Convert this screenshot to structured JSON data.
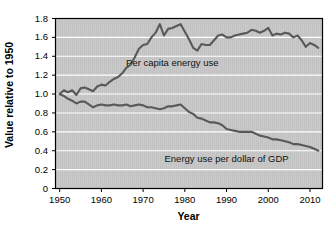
{
  "chart_data": {
    "type": "line",
    "title": "",
    "xlabel": "Year",
    "ylabel": "Value relative to 1950",
    "xlim": [
      1949,
      2013
    ],
    "ylim": [
      0,
      1.8
    ],
    "xticks": [
      1950,
      1960,
      1970,
      1980,
      1990,
      2000,
      2010
    ],
    "xtick_labels": [
      "1950",
      "1960",
      "1970",
      "1980",
      "1990",
      "2000",
      "2010"
    ],
    "yticks": [
      0,
      0.2,
      0.4,
      0.6,
      0.8,
      1.0,
      1.2,
      1.4,
      1.6,
      1.8
    ],
    "ytick_labels": [
      "0",
      "0.2",
      "0.4",
      "0.6",
      "0.8",
      "1.0",
      "1.2",
      "1.4",
      "1.6",
      "1.8"
    ],
    "grid": "horizontal-white",
    "legend": "inline-annotations",
    "plot_bgcolor": "#c9c9c9",
    "line_color": "#595959",
    "gridline_color": "#ffffff",
    "border_color": "#000000",
    "annotations": [
      {
        "text": "Per capita energy use",
        "x": 1977,
        "y": 1.3
      },
      {
        "text": "Energy use per dollar of GDP",
        "x": 1990,
        "y": 0.28
      }
    ],
    "series": [
      {
        "name": "Per capita energy use",
        "x": [
          1950,
          1951,
          1952,
          1953,
          1954,
          1955,
          1956,
          1957,
          1958,
          1959,
          1960,
          1961,
          1962,
          1963,
          1964,
          1965,
          1966,
          1967,
          1968,
          1969,
          1970,
          1971,
          1972,
          1973,
          1974,
          1975,
          1976,
          1977,
          1978,
          1979,
          1980,
          1981,
          1982,
          1983,
          1984,
          1985,
          1986,
          1987,
          1988,
          1989,
          1990,
          1991,
          1992,
          1993,
          1994,
          1995,
          1996,
          1997,
          1998,
          1999,
          2000,
          2001,
          2002,
          2003,
          2004,
          2005,
          2006,
          2007,
          2008,
          2009,
          2010,
          2011,
          2012
        ],
        "values": [
          1.0,
          1.04,
          1.02,
          1.04,
          0.99,
          1.06,
          1.07,
          1.05,
          1.03,
          1.08,
          1.1,
          1.09,
          1.13,
          1.16,
          1.18,
          1.22,
          1.28,
          1.31,
          1.39,
          1.48,
          1.52,
          1.53,
          1.6,
          1.65,
          1.74,
          1.62,
          1.69,
          1.7,
          1.72,
          1.74,
          1.66,
          1.58,
          1.49,
          1.46,
          1.53,
          1.52,
          1.52,
          1.57,
          1.62,
          1.63,
          1.6,
          1.6,
          1.62,
          1.63,
          1.64,
          1.65,
          1.68,
          1.67,
          1.65,
          1.67,
          1.7,
          1.62,
          1.64,
          1.63,
          1.65,
          1.64,
          1.6,
          1.62,
          1.57,
          1.5,
          1.54,
          1.52,
          1.49
        ]
      },
      {
        "name": "Energy use per dollar of GDP",
        "x": [
          1950,
          1951,
          1952,
          1953,
          1954,
          1955,
          1956,
          1957,
          1958,
          1959,
          1960,
          1961,
          1962,
          1963,
          1964,
          1965,
          1966,
          1967,
          1968,
          1969,
          1970,
          1971,
          1972,
          1973,
          1974,
          1975,
          1976,
          1977,
          1978,
          1979,
          1980,
          1981,
          1982,
          1983,
          1984,
          1985,
          1986,
          1987,
          1988,
          1989,
          1990,
          1991,
          1992,
          1993,
          1994,
          1995,
          1996,
          1997,
          1998,
          1999,
          2000,
          2001,
          2002,
          2003,
          2004,
          2005,
          2006,
          2007,
          2008,
          2009,
          2010,
          2011,
          2012
        ],
        "values": [
          1.0,
          0.98,
          0.95,
          0.93,
          0.9,
          0.92,
          0.92,
          0.89,
          0.86,
          0.88,
          0.89,
          0.88,
          0.88,
          0.89,
          0.88,
          0.88,
          0.89,
          0.87,
          0.88,
          0.89,
          0.88,
          0.86,
          0.86,
          0.85,
          0.84,
          0.85,
          0.87,
          0.87,
          0.88,
          0.89,
          0.85,
          0.81,
          0.79,
          0.75,
          0.74,
          0.72,
          0.7,
          0.7,
          0.69,
          0.67,
          0.63,
          0.62,
          0.61,
          0.6,
          0.6,
          0.6,
          0.6,
          0.58,
          0.56,
          0.55,
          0.54,
          0.52,
          0.52,
          0.51,
          0.5,
          0.49,
          0.47,
          0.47,
          0.46,
          0.45,
          0.44,
          0.42,
          0.4
        ]
      }
    ]
  }
}
